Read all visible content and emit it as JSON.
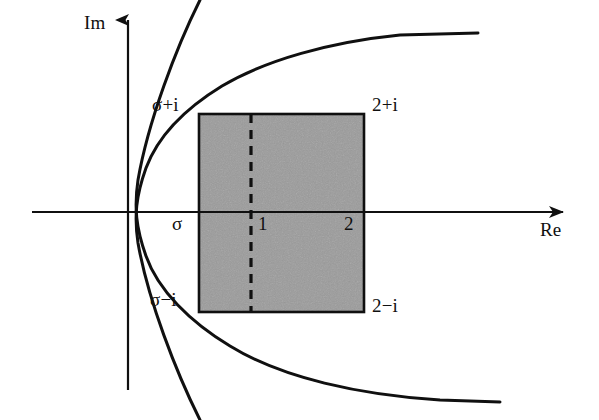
{
  "figure": {
    "axes": {
      "imaginary_label": "Im",
      "real_label": "Re"
    },
    "labels": {
      "top_left_corner": "σ+i",
      "top_right_corner": "2+i",
      "bottom_left_corner": "σ−i",
      "bottom_right_corner": "2−i",
      "sigma_tick": "σ",
      "one_tick": "1",
      "two_tick": "2"
    },
    "colors": {
      "ink": "#101010",
      "shade_fill": "#9b9b9b",
      "shade_border": "#101010",
      "background": "#ffffff"
    }
  },
  "chart_data": {
    "type": "line",
    "xlabel": "Re",
    "ylabel": "Im",
    "grid": false,
    "legend": null,
    "origin_px": [
      128,
      212
    ],
    "axis_ranges": {
      "x_px": [
        32,
        565
      ],
      "y_px": [
        18,
        390
      ]
    },
    "annotations": [
      {
        "text": "Im",
        "x_px": 88,
        "y_px": 22
      },
      {
        "text": "Re",
        "x_px": 540,
        "y_px": 226
      },
      {
        "text": "σ+i",
        "x_px": 155,
        "y_px": 101
      },
      {
        "text": "2+i",
        "x_px": 374,
        "y_px": 101
      },
      {
        "text": "σ",
        "x_px": 172,
        "y_px": 218
      },
      {
        "text": "1",
        "x_px": 258,
        "y_px": 218
      },
      {
        "text": "2",
        "x_px": 345,
        "y_px": 218
      },
      {
        "text": "σ−i",
        "x_px": 152,
        "y_px": 293
      },
      {
        "text": "2−i",
        "x_px": 374,
        "y_px": 300
      }
    ],
    "shaded_rectangle": {
      "label": "critical strip region",
      "x_left_px": 199,
      "x_right_px": 364,
      "y_top_px": 114,
      "y_bottom_px": 312,
      "fill": "#9b9b9b",
      "corners": [
        "σ+i",
        "2+i",
        "2−i",
        "σ−i"
      ]
    },
    "dashed_line": {
      "label": "Re = 1",
      "x_px": 251,
      "y_top_px": 114,
      "y_bottom_px": 312,
      "dash": "9 7"
    },
    "series": [
      {
        "name": "upper-branch",
        "path_px": [
          [
            200,
            420
          ],
          [
            165,
            330
          ],
          [
            143,
            268
          ],
          [
            136,
            228
          ],
          [
            136,
            212
          ],
          [
            138,
            190
          ],
          [
            146,
            160
          ],
          [
            162,
            132
          ],
          [
            186,
            106
          ],
          [
            218,
            82
          ],
          [
            258,
            62
          ],
          [
            305,
            48
          ],
          [
            360,
            39
          ],
          [
            420,
            34
          ],
          [
            478,
            33
          ]
        ]
      },
      {
        "name": "lower-branch",
        "path_px": [
          [
            200,
            0
          ],
          [
            165,
            90
          ],
          [
            143,
            152
          ],
          [
            136,
            196
          ],
          [
            136,
            212
          ],
          [
            138,
            236
          ],
          [
            146,
            268
          ],
          [
            162,
            298
          ],
          [
            188,
            326
          ],
          [
            222,
            352
          ],
          [
            265,
            372
          ],
          [
            318,
            388
          ],
          [
            380,
            397
          ],
          [
            440,
            401
          ],
          [
            500,
            402
          ]
        ]
      }
    ]
  }
}
